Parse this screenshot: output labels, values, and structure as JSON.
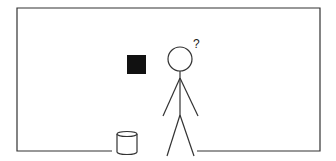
{
  "scene": {
    "description": "Stick figure puzzled next to a black square and a bucket inside a room outline",
    "thought_symbol": "?",
    "colors": {
      "line": "#333333",
      "square_fill": "#111111",
      "background": "#ffffff"
    },
    "objects": [
      {
        "name": "room-outline",
        "type": "open-rectangle"
      },
      {
        "name": "black-square",
        "type": "filled-square"
      },
      {
        "name": "stick-figure",
        "type": "person"
      },
      {
        "name": "question-mark",
        "type": "text",
        "text": "?"
      },
      {
        "name": "bucket",
        "type": "cylinder"
      }
    ]
  }
}
